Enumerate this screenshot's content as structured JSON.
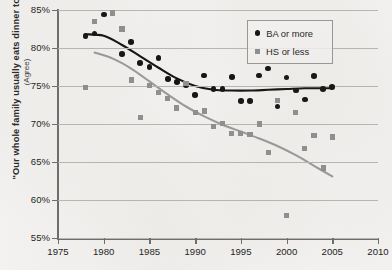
{
  "chart_data": {
    "type": "scatter",
    "title": "",
    "xlabel": "",
    "ylabel": "\"Our whole family usually eats dinner together\"",
    "ylabel_sub": "(Agree)",
    "xlim": [
      1975,
      2010
    ],
    "ylim": [
      55,
      85
    ],
    "grid": "horizontal",
    "legend_position": "top-right",
    "xticks": [
      1975,
      1980,
      1985,
      1990,
      1995,
      2000,
      2005,
      2010
    ],
    "xtick_labels": [
      "1975",
      "1980",
      "1985",
      "1990",
      "1995",
      "2000",
      "2005",
      "2010"
    ],
    "yticks": [
      55,
      60,
      65,
      70,
      75,
      80,
      85
    ],
    "ytick_labels": [
      "55%",
      "60%",
      "65%",
      "70%",
      "75%",
      "80%",
      "85%"
    ],
    "series": [
      {
        "name": "BA or more",
        "marker": "circle",
        "color": "#111111",
        "points": [
          {
            "x": 1978,
            "y": 81.6
          },
          {
            "x": 1979,
            "y": 81.9
          },
          {
            "x": 1980,
            "y": 84.4
          },
          {
            "x": 1982,
            "y": 79.2
          },
          {
            "x": 1983,
            "y": 80.8
          },
          {
            "x": 1984,
            "y": 78.0
          },
          {
            "x": 1985,
            "y": 77.5
          },
          {
            "x": 1986,
            "y": 78.7
          },
          {
            "x": 1987,
            "y": 75.9
          },
          {
            "x": 1988,
            "y": 75.5
          },
          {
            "x": 1989,
            "y": 75.1
          },
          {
            "x": 1990,
            "y": 73.8
          },
          {
            "x": 1991,
            "y": 76.4
          },
          {
            "x": 1992,
            "y": 74.6
          },
          {
            "x": 1993,
            "y": 74.6
          },
          {
            "x": 1994,
            "y": 76.2
          },
          {
            "x": 1995,
            "y": 73.0
          },
          {
            "x": 1996,
            "y": 73.0
          },
          {
            "x": 1997,
            "y": 76.4
          },
          {
            "x": 1998,
            "y": 77.3
          },
          {
            "x": 1999,
            "y": 72.3
          },
          {
            "x": 2000,
            "y": 76.1
          },
          {
            "x": 2001,
            "y": 74.4
          },
          {
            "x": 2002,
            "y": 73.2
          },
          {
            "x": 2003,
            "y": 76.3
          },
          {
            "x": 2004,
            "y": 74.6
          },
          {
            "x": 2005,
            "y": 74.9
          }
        ]
      },
      {
        "name": "HS or less",
        "marker": "square",
        "color": "#8f8f8f",
        "points": [
          {
            "x": 1978,
            "y": 74.8
          },
          {
            "x": 1979,
            "y": 83.5
          },
          {
            "x": 1981,
            "y": 84.6
          },
          {
            "x": 1982,
            "y": 82.5
          },
          {
            "x": 1983,
            "y": 75.8
          },
          {
            "x": 1984,
            "y": 70.9
          },
          {
            "x": 1985,
            "y": 75.1
          },
          {
            "x": 1986,
            "y": 74.1
          },
          {
            "x": 1987,
            "y": 73.4
          },
          {
            "x": 1988,
            "y": 72.1
          },
          {
            "x": 1989,
            "y": 75.3
          },
          {
            "x": 1990,
            "y": 71.5
          },
          {
            "x": 1991,
            "y": 71.7
          },
          {
            "x": 1992,
            "y": 69.7
          },
          {
            "x": 1993,
            "y": 70.1
          },
          {
            "x": 1994,
            "y": 68.8
          },
          {
            "x": 1995,
            "y": 68.8
          },
          {
            "x": 1996,
            "y": 68.6
          },
          {
            "x": 1997,
            "y": 70.0
          },
          {
            "x": 1998,
            "y": 66.3
          },
          {
            "x": 1999,
            "y": 73.1
          },
          {
            "x": 2000,
            "y": 58.0
          },
          {
            "x": 2001,
            "y": 71.5
          },
          {
            "x": 2002,
            "y": 66.8
          },
          {
            "x": 2003,
            "y": 68.5
          },
          {
            "x": 2004,
            "y": 64.2
          },
          {
            "x": 2005,
            "y": 68.3
          }
        ]
      }
    ],
    "trend_lines": [
      {
        "name": "BA or more trend",
        "color": "#111111",
        "points": [
          {
            "x": 1978,
            "y": 81.8
          },
          {
            "x": 1980,
            "y": 81.6
          },
          {
            "x": 1982,
            "y": 80.4
          },
          {
            "x": 1984,
            "y": 78.9
          },
          {
            "x": 1986,
            "y": 77.4
          },
          {
            "x": 1988,
            "y": 76.0
          },
          {
            "x": 1990,
            "y": 75.0
          },
          {
            "x": 1992,
            "y": 74.5
          },
          {
            "x": 1994,
            "y": 74.4
          },
          {
            "x": 1996,
            "y": 74.4
          },
          {
            "x": 1998,
            "y": 74.5
          },
          {
            "x": 2000,
            "y": 74.6
          },
          {
            "x": 2002,
            "y": 74.7
          },
          {
            "x": 2004,
            "y": 74.7
          },
          {
            "x": 2005,
            "y": 74.7
          }
        ]
      },
      {
        "name": "HS or less trend",
        "color": "#9a9a9a",
        "points": [
          {
            "x": 1979,
            "y": 79.4
          },
          {
            "x": 1981,
            "y": 78.6
          },
          {
            "x": 1983,
            "y": 77.3
          },
          {
            "x": 1985,
            "y": 75.6
          },
          {
            "x": 1987,
            "y": 73.9
          },
          {
            "x": 1989,
            "y": 72.3
          },
          {
            "x": 1991,
            "y": 71.0
          },
          {
            "x": 1993,
            "y": 69.9
          },
          {
            "x": 1995,
            "y": 69.0
          },
          {
            "x": 1997,
            "y": 68.1
          },
          {
            "x": 1999,
            "y": 67.1
          },
          {
            "x": 2001,
            "y": 65.9
          },
          {
            "x": 2003,
            "y": 64.5
          },
          {
            "x": 2005,
            "y": 63.1
          }
        ]
      }
    ]
  },
  "legend": {
    "items": [
      {
        "label": "BA or more",
        "marker": "circle"
      },
      {
        "label": "HS or less",
        "marker": "square"
      }
    ]
  },
  "footnote": ""
}
